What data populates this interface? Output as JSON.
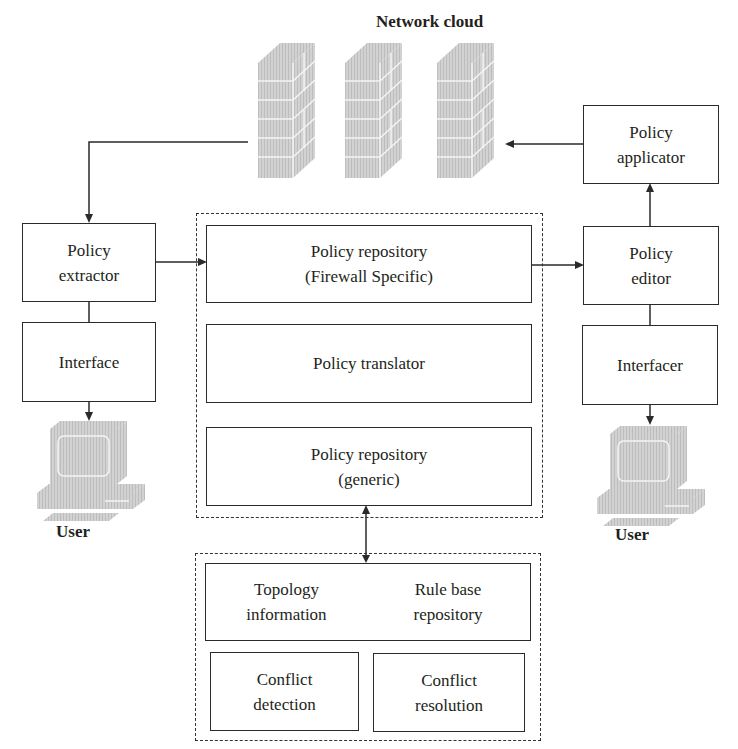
{
  "title": "Network cloud",
  "boxes": {
    "policy_extractor": [
      "Policy",
      "extractor"
    ],
    "interface_left": [
      "Interface"
    ],
    "repo_fw": [
      "Policy repository",
      "(Firewall Specific)"
    ],
    "translator": [
      "Policy translator"
    ],
    "repo_generic": [
      "Policy repository",
      "(generic)"
    ],
    "topology": [
      "Topology",
      "information"
    ],
    "rulebase": [
      "Rule base",
      "repository"
    ],
    "conflict_detection": [
      "Conflict",
      "detection"
    ],
    "conflict_resolution": [
      "Conflict",
      "resolution"
    ],
    "policy_applicator": [
      "Policy",
      "applicator"
    ],
    "policy_editor": [
      "Policy",
      "editor"
    ],
    "interfacer": [
      "Interfacer"
    ]
  },
  "user_left": "User",
  "user_right": "User",
  "icons": {
    "firewalls": [
      "firewall-icon",
      "firewall-icon",
      "firewall-icon"
    ],
    "computers": [
      "computer-icon",
      "computer-icon"
    ]
  },
  "colors": {
    "line": "#2a2a2a",
    "icon_fill": "#c8c8c8",
    "icon_highlight": "#f2f2f2"
  }
}
